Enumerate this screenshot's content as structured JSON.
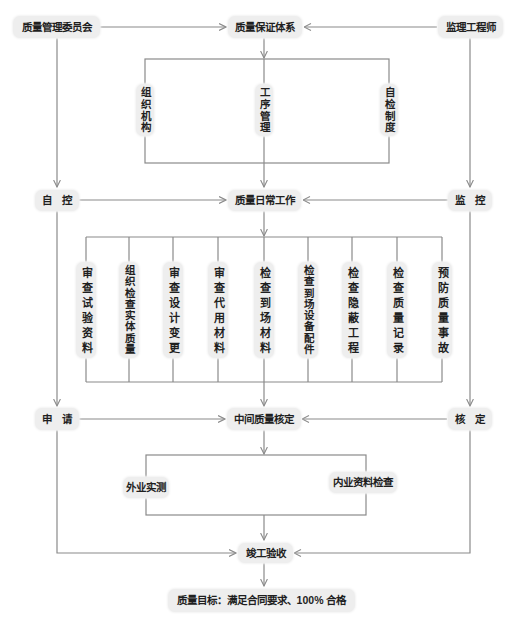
{
  "diagram": {
    "top": {
      "committee": "质量管理委员会",
      "system": "质量保证体系",
      "supervisor": "监理工程师"
    },
    "system_elements": [
      "组织机构",
      "工序管理",
      "自检制度"
    ],
    "control_row": {
      "self_control": "自　控",
      "daily_work": "质量日常工作",
      "monitoring": "监　控"
    },
    "daily_tasks": [
      "审查试验资料",
      "组织检查实体质量",
      "审查设计变更",
      "审查代用材料",
      "检查到场材料",
      "检查到场设备配件",
      "检查隐蔽工程",
      "检查质量记录",
      "预防质量事故"
    ],
    "verification_row": {
      "application": "申　请",
      "interim_check": "中间质量核定",
      "approval": "核　定"
    },
    "interim_checks": [
      "外业实测",
      "内业资料检查"
    ],
    "completion": "竣工验收",
    "goal": "质量目标：满足合同要求、100% 合格"
  },
  "colors": {
    "background": "#ffffff",
    "node_fill": "#eeeeee",
    "connector": "#8a8a8a",
    "text": "#1f1f1f"
  }
}
